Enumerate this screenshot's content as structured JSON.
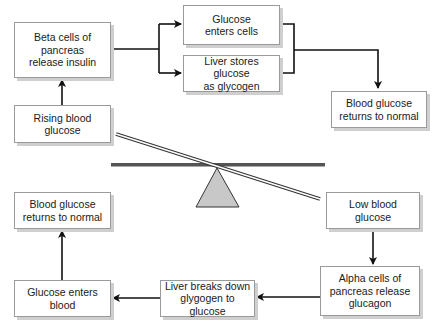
{
  "diagram": {
    "title": "",
    "boxes": {
      "beta_cells": "Beta cells of\npancreas\nrelease insulin",
      "rising_glucose": "Rising blood\nglucose",
      "glucose_enters_cells": "Glucose\nenters cells",
      "liver_stores": "Liver stores glucose\nas glycogen",
      "returns_normal_top": "Blood glucose\nreturns to normal",
      "low_glucose": "Low blood\nglucose",
      "alpha_cells": "Alpha cells of\npancreas release\nglucagon",
      "liver_breaks": "Liver breaks down\nglygogen to glucose",
      "glucose_enters_blood": "Glucose enters\nblood",
      "returns_normal_bottom": "Blood glucose\nreturns to normal"
    },
    "colors": {
      "box_border": "#9a9a9a",
      "box_shadow": "#cfcfcf",
      "arrow": "#111111",
      "seesaw_bar": "#555555",
      "fulcrum_fill": "#c8c8c8"
    }
  }
}
